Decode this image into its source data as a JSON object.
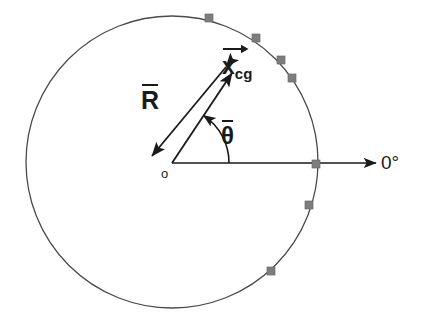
{
  "figure": {
    "background_color": "#ffffff",
    "width": 421,
    "height": 323
  },
  "geometry": {
    "circle": {
      "center_x": 172,
      "center_y": 162,
      "radius": 146,
      "stroke_color": "#4a4a4a",
      "stroke_width": 1.3,
      "fill": "none"
    },
    "origin": {
      "x": 172,
      "y": 163
    },
    "axis_zero": {
      "from_x": 172,
      "from_y": 163,
      "to_x": 378,
      "to_y": 163,
      "stroke_color": "#1a1a1a",
      "stroke_width": 1.6
    },
    "vector_R": {
      "tail_x": 226,
      "tail_y": 67,
      "head_x": 152,
      "head_y": 156,
      "double_headed": true,
      "stroke_color": "#1a1a1a",
      "stroke_width": 1.8
    },
    "vector_xcg": {
      "tail_x": 172,
      "tail_y": 163,
      "head_x": 232,
      "head_y": 73,
      "double_headed": false,
      "stroke_color": "#1a1a1a",
      "stroke_width": 1.8
    },
    "angle_arc": {
      "center_x": 172,
      "center_y": 163,
      "radius": 57,
      "start_deg": 0,
      "end_deg": 56,
      "arrow_at": "end",
      "stroke_color": "#1a1a1a",
      "stroke_width": 1.6
    }
  },
  "markers": {
    "shape": "square",
    "size": 8,
    "fill_color": "#7d7d7d",
    "stroke_color": "#6b6b6b",
    "points": [
      {
        "x": 209,
        "y": 18,
        "name": "marker-1"
      },
      {
        "x": 256,
        "y": 38,
        "name": "marker-2"
      },
      {
        "x": 281,
        "y": 60,
        "name": "marker-3"
      },
      {
        "x": 292,
        "y": 78,
        "name": "marker-4"
      },
      {
        "x": 316,
        "y": 164,
        "name": "marker-5"
      },
      {
        "x": 309,
        "y": 205,
        "name": "marker-6"
      },
      {
        "x": 271,
        "y": 271,
        "name": "marker-7"
      }
    ]
  },
  "labels": {
    "radius_vector": "R",
    "cg_vector_base": "x",
    "cg_vector_subscript": "cg",
    "angle": "θ",
    "origin": "o",
    "zero_degrees": "0°"
  },
  "colors": {
    "line": "#1a1a1a",
    "circle": "#4a4a4a",
    "marker": "#7d7d7d",
    "text": "#1a1a1a",
    "background": "#ffffff"
  }
}
